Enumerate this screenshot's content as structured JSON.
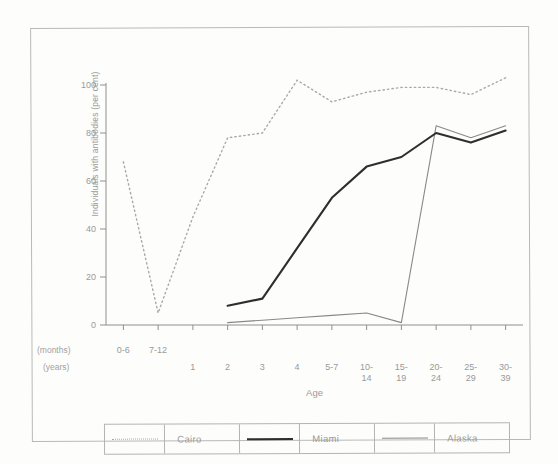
{
  "chart_data": {
    "type": "line",
    "title": "",
    "xlabel": "Age",
    "ylabel": "Individuals with antibodies (per cent)",
    "ylim": [
      0,
      110
    ],
    "yticks": [
      0,
      20,
      40,
      60,
      80,
      100
    ],
    "grid": false,
    "legend_position": "bottom",
    "categories": [
      "0-6",
      "7-12",
      "1",
      "2",
      "3",
      "4",
      "5-7",
      "10-14",
      "15-19",
      "20-24",
      "25-29",
      "30-39"
    ],
    "category_rows": {
      "months_label": "(months)",
      "years_label": "(years)",
      "months": [
        "0-6",
        "7-12"
      ],
      "years": [
        "1",
        "2",
        "3",
        "4",
        "5-7",
        "10-14",
        "15-19",
        "20-24",
        "25-29",
        "30-39"
      ]
    },
    "series": [
      {
        "name": "Cairo",
        "style": "dotted",
        "color": "#a9a9a6",
        "x": [
          "0-6",
          "7-12",
          "1",
          "2",
          "3",
          "4",
          "5-7",
          "10-14",
          "15-19",
          "20-24",
          "25-29",
          "30-39"
        ],
        "values": [
          68,
          5,
          45,
          78,
          80,
          102,
          93,
          97,
          99,
          99,
          96,
          103
        ]
      },
      {
        "name": "Miami",
        "style": "solid-thick",
        "color": "#2e2e2e",
        "x": [
          "2",
          "3",
          "4",
          "5-7",
          "10-14",
          "15-19",
          "20-24",
          "25-29",
          "30-39"
        ],
        "values": [
          8,
          11,
          32,
          53,
          66,
          70,
          80,
          76,
          81
        ]
      },
      {
        "name": "Alaska",
        "style": "solid-thin",
        "color": "#898987",
        "x": [
          "2",
          "3",
          "4",
          "5-7",
          "10-14",
          "15-19",
          "20-24",
          "25-29",
          "30-39"
        ],
        "values": [
          1,
          2,
          3,
          4,
          5,
          1,
          83,
          78,
          83
        ]
      }
    ],
    "legend": [
      {
        "label": "Cairo",
        "style": "dotted"
      },
      {
        "label": "Miami",
        "style": "solid-thick"
      },
      {
        "label": "Alaska",
        "style": "solid-thin"
      }
    ]
  }
}
